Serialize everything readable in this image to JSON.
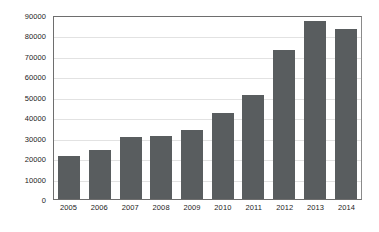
{
  "chart_data": {
    "type": "bar",
    "title": "",
    "subtitle": "",
    "xlabel": "",
    "ylabel": "",
    "categories": [
      "2005",
      "2006",
      "2007",
      "2008",
      "2009",
      "2010",
      "2011",
      "2012",
      "2013",
      "2014"
    ],
    "values": [
      21000,
      24000,
      30500,
      31000,
      34000,
      42000,
      51000,
      73000,
      87000,
      83000
    ],
    "series": [
      {
        "name": "",
        "values": [
          21000,
          24000,
          30500,
          31000,
          34000,
          42000,
          51000,
          73000,
          87000,
          83000
        ]
      }
    ],
    "ylim": [
      0,
      90000
    ],
    "yticks": [
      0,
      10000,
      20000,
      30000,
      40000,
      50000,
      60000,
      70000,
      80000,
      90000
    ],
    "ytick_labels": [
      "0",
      "10000",
      "20000",
      "30000",
      "40000",
      "50000",
      "60000",
      "70000",
      "80000",
      "90000"
    ],
    "grid": true,
    "grid_axis": "y",
    "legend": false,
    "legend_position": "none",
    "annotations": [],
    "colors": {
      "bar": "#595d5f",
      "grid": "#e2e2e2",
      "axis": "#6e6e6e",
      "text": "#1c1c1c",
      "background": "#ffffff"
    }
  }
}
